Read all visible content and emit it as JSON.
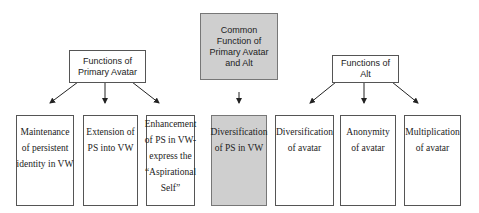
{
  "diagram": {
    "primary": {
      "title_lines": [
        "Functions of",
        "Primary Avatar"
      ],
      "children": [
        {
          "lines": [
            "Maintenance",
            "of persistent",
            "identity in VW"
          ]
        },
        {
          "lines": [
            "Extension of",
            "PS into VW"
          ]
        },
        {
          "lines": [
            "Enhancement",
            "of PS in VW-",
            "express the",
            "“Aspirational",
            "Self”"
          ]
        }
      ]
    },
    "common": {
      "title_lines": [
        "Common",
        "Function of",
        "Primary Avatar",
        "and Alt"
      ],
      "child": {
        "lines": [
          "Diversification",
          "of PS in VW"
        ]
      },
      "fill_color": "#cfcfcf"
    },
    "alt": {
      "title_lines": [
        "Functions of",
        "Alt"
      ],
      "children": [
        {
          "lines": [
            "Diversification",
            "of avatar"
          ]
        },
        {
          "lines": [
            "Anonymity",
            "of avatar"
          ]
        },
        {
          "lines": [
            "Multiplication",
            "of avatar"
          ]
        }
      ]
    }
  }
}
